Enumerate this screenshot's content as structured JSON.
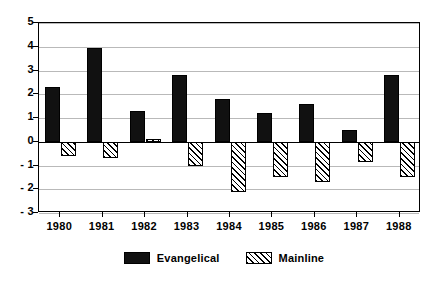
{
  "chart_data": {
    "type": "bar",
    "title": "",
    "subtitle": "",
    "xlabel": "",
    "ylabel": "",
    "categories": [
      "1980",
      "1981",
      "1982",
      "1983",
      "1984",
      "1985",
      "1986",
      "1987",
      "1988"
    ],
    "series": [
      {
        "name": "Evangelical",
        "fill": "solid-black",
        "color": "#111111",
        "values": [
          2.3,
          3.95,
          1.3,
          2.8,
          1.8,
          1.2,
          1.6,
          0.5,
          2.8
        ]
      },
      {
        "name": "Mainline",
        "fill": "diagonal-hatch",
        "color": "#ffffff",
        "values": [
          -0.6,
          -0.7,
          0.1,
          -1.0,
          -2.1,
          -1.5,
          -1.7,
          -0.85,
          -1.5
        ]
      }
    ],
    "ylim": [
      -3,
      5
    ],
    "ytick_values": [
      5,
      4,
      3,
      2,
      1,
      0,
      -1,
      -2,
      -3
    ],
    "ytick_labels": [
      "5",
      "4",
      "3",
      "2",
      "1",
      "0",
      "- 1",
      "- 2",
      "- 3"
    ],
    "grid": true,
    "grid_axis": "y",
    "legend_position": "bottom-center",
    "legend": [
      "Evangelical",
      "Mainline"
    ]
  }
}
